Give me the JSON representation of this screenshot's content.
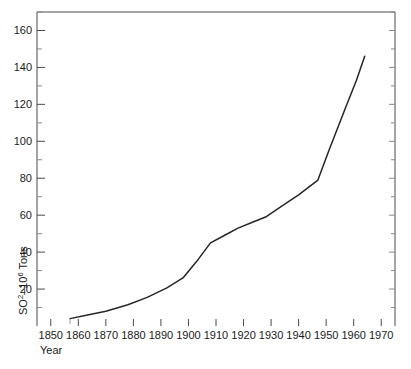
{
  "chart_data": {
    "type": "line",
    "title": "",
    "subtitle": "",
    "xlabel": "Year",
    "ylabel": "SO2 – 10^6 Tons",
    "ylabel_base": "SO",
    "ylabel_sup1": "2",
    "ylabel_mid": "–10",
    "ylabel_sup2": "6",
    "ylabel_tail": " Tons",
    "xlim": [
      1845,
      1975
    ],
    "ylim": [
      0,
      170
    ],
    "grid": false,
    "legend": "none",
    "x_ticks": [
      1850,
      1860,
      1870,
      1880,
      1890,
      1900,
      1910,
      1920,
      1930,
      1940,
      1950,
      1960,
      1970
    ],
    "x_tick_labels": [
      "1850",
      "1860",
      "1870",
      "1880",
      "1890",
      "1900",
      "1910",
      "1920",
      "1930",
      "1940",
      "1950",
      "1960",
      "1970"
    ],
    "y_ticks": [
      20,
      40,
      60,
      80,
      100,
      120,
      140,
      160
    ],
    "y_tick_labels": [
      "20",
      "40",
      "60",
      "80",
      "100",
      "120",
      "140",
      "160"
    ],
    "y_minor_ticks": [
      10,
      30,
      50,
      70,
      90,
      110,
      130,
      150,
      170
    ],
    "series": [
      {
        "name": "SO2 emissions",
        "color": "#262626",
        "x": [
          1857,
          1862,
          1870,
          1878,
          1885,
          1892,
          1898,
          1903,
          1908,
          1913,
          1918,
          1923,
          1928,
          1934,
          1940,
          1947,
          1951,
          1957,
          1961,
          1964
        ],
        "values": [
          4,
          5.5,
          8,
          11.5,
          15.5,
          20.5,
          26,
          35,
          45,
          49,
          53,
          56,
          59,
          65,
          71,
          79,
          95,
          118,
          133,
          146
        ]
      }
    ]
  },
  "axes": {
    "frame_color": "#4a4a4a",
    "tick_color": "#4a4a4a",
    "minor_tick_color": "#8a8a8a"
  }
}
